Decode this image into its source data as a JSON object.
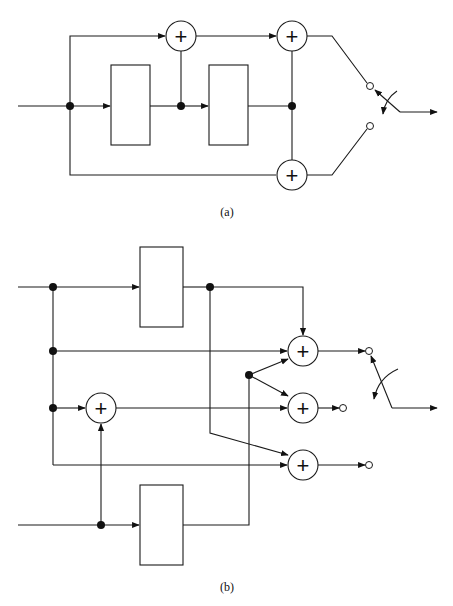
{
  "figure": {
    "panels": [
      {
        "id": "a",
        "caption": "(a)",
        "blocks": 2,
        "adders": 3,
        "adder_symbol": "+",
        "switch_positions": 2
      },
      {
        "id": "b",
        "caption": "(b)",
        "blocks": 2,
        "adders": 4,
        "adder_symbol": "+",
        "switch_positions": 3
      }
    ],
    "colors": {
      "line": "#1a1a1a",
      "background": "#ffffff",
      "junction": "#111111"
    }
  }
}
